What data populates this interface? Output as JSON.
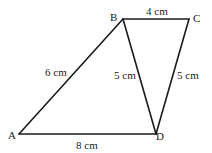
{
  "diagram": {
    "type": "quadrilateral with diagonal",
    "vertices": [
      {
        "id": "A",
        "label": "A",
        "x": 19,
        "y": 134,
        "lx": 8,
        "ly": 139
      },
      {
        "id": "B",
        "label": "B",
        "x": 123,
        "y": 19,
        "lx": 110,
        "ly": 21
      },
      {
        "id": "C",
        "label": "C",
        "x": 189,
        "y": 19,
        "lx": 193,
        "ly": 22
      },
      {
        "id": "D",
        "label": "D",
        "x": 156,
        "y": 134,
        "lx": 156,
        "ly": 140
      }
    ],
    "edges": [
      {
        "from": "A",
        "to": "B",
        "length": "6cm",
        "label": "6 cm",
        "lx": 45,
        "ly": 76
      },
      {
        "from": "B",
        "to": "C",
        "length": "4cm",
        "label": "4 cm",
        "lx": 146,
        "ly": 15
      },
      {
        "from": "C",
        "to": "D",
        "length": "5cm",
        "label": "5 cm",
        "lx": 177,
        "ly": 79
      },
      {
        "from": "B",
        "to": "D",
        "length": "5cm",
        "label": "5 cm",
        "lx": 114,
        "ly": 79
      },
      {
        "from": "A",
        "to": "D",
        "length": "8cm",
        "label": "8 cm",
        "lx": 76,
        "ly": 149
      }
    ],
    "colors": {
      "line": "#1a1a1a",
      "text": "#222222",
      "background": "#ffffff"
    }
  }
}
